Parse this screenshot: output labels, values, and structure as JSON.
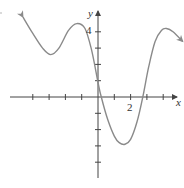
{
  "chart_data": {
    "type": "line",
    "title": "",
    "xlabel": "x",
    "ylabel": "y",
    "x_tick_labels": [
      {
        "value": 2,
        "label": "2"
      }
    ],
    "y_tick_labels": [
      {
        "value": 4,
        "label": "4"
      }
    ],
    "x_ticks": [
      -4,
      -3,
      -2,
      -1,
      1,
      2,
      3,
      4
    ],
    "y_ticks": [
      -4,
      -3,
      -2,
      -1,
      1,
      2,
      3,
      4
    ],
    "xlim": [
      -4.0,
      4.9
    ],
    "ylim": [
      -4.9,
      5.2
    ],
    "grid": false,
    "legend": null,
    "series": [
      {
        "name": "f(x)",
        "arrows_at_ends": true,
        "x": [
          -4.6,
          -4.0,
          -3.4,
          -2.9,
          -2.4,
          -1.8,
          -1.3,
          -0.8,
          -0.4,
          0.0,
          0.2,
          0.6,
          1.0,
          1.3,
          1.65,
          2.0,
          2.4,
          2.75,
          3.1,
          3.5,
          3.9,
          4.2,
          4.6,
          5.2
        ],
        "y": [
          4.9,
          3.9,
          3.0,
          2.6,
          3.0,
          4.1,
          4.5,
          4.2,
          2.9,
          0.9,
          0.0,
          -1.4,
          -2.4,
          -2.8,
          -2.9,
          -2.6,
          -1.5,
          0.0,
          1.8,
          3.4,
          4.1,
          4.2,
          4.0,
          3.4
        ]
      }
    ],
    "annotations": [],
    "colors": {
      "curve": "#8a8a8a",
      "axes": "#444444"
    }
  },
  "labels": {
    "x_axis": "x",
    "y_axis": "y",
    "tick_x2": "2",
    "tick_y4": "4"
  }
}
